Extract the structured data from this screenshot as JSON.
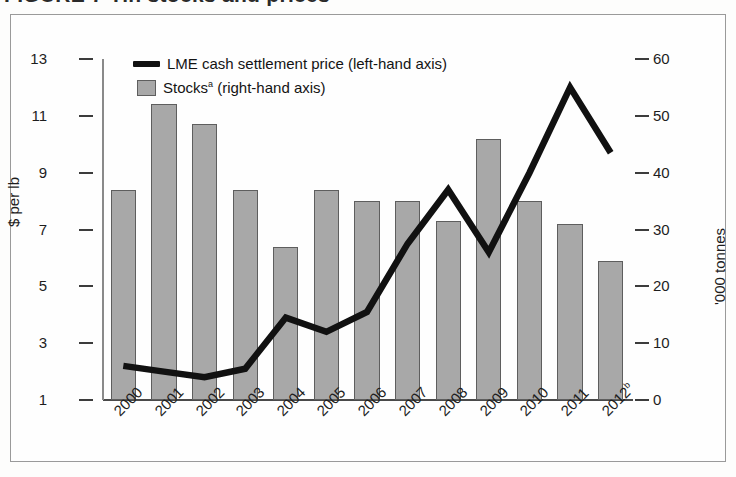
{
  "figure": {
    "title_fragment": "FIGURE 7  Tin stocks and prices",
    "y_left_label": "$ per lb",
    "y_right_label": "'000 tonnes"
  },
  "legend": {
    "items": [
      {
        "name": "lme-price",
        "label": "LME cash settlement price (left-hand axis)",
        "marker": "line",
        "color": "#111111"
      },
      {
        "name": "stocks",
        "label": "Stocks",
        "sup": "a",
        "label_tail": " (right-hand axis)",
        "marker": "swatch",
        "color": "#a8a8a8"
      }
    ]
  },
  "chart_data": {
    "type": "bar",
    "title": "Tin stocks and prices",
    "xlabel": "",
    "ylabel": "$ per lb",
    "y2label": "'000 tonnes",
    "categories": [
      "2000",
      "2001",
      "2002",
      "2003",
      "2004",
      "2005",
      "2006",
      "2007",
      "2008",
      "2009",
      "2010",
      "2011",
      "2012"
    ],
    "category_notes": {
      "2012": "b"
    },
    "ylim": [
      1,
      13
    ],
    "y_ticks": [
      1,
      3,
      5,
      7,
      9,
      11,
      13
    ],
    "y2lim": [
      0,
      60
    ],
    "y2_ticks": [
      0,
      10,
      20,
      30,
      40,
      50,
      60
    ],
    "grid": false,
    "legend_position": "top-left",
    "series": [
      {
        "name": "Stocks",
        "kind": "bar",
        "axis": "right",
        "unit": "'000 tonnes",
        "color": "#a8a8a8",
        "edge_color": "#5e5e5e",
        "values": [
          37.0,
          52.0,
          48.5,
          37.0,
          27.0,
          37.0,
          35.0,
          35.0,
          31.5,
          46.0,
          35.0,
          31.0,
          24.5
        ]
      },
      {
        "name": "LME cash settlement price",
        "kind": "line",
        "axis": "left",
        "unit": "$ per lb",
        "color": "#111111",
        "values": [
          2.2,
          2.0,
          1.8,
          2.1,
          3.9,
          3.4,
          4.1,
          6.5,
          8.4,
          6.2,
          9.0,
          12.0,
          9.7
        ]
      }
    ]
  }
}
